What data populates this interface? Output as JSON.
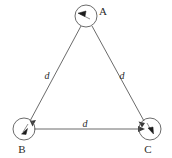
{
  "figure": {
    "type": "physics-diagram",
    "background_color": "#ffffff",
    "line_color": "#5a5a5a",
    "text_color": "#2b2b2b",
    "arrow_color": "#1c1c1c",
    "vertices": [
      {
        "id": "A",
        "label": "A",
        "position": {
          "x": 86,
          "y": 16
        },
        "radius": 11,
        "label_position": {
          "x": 103,
          "y": 14
        },
        "velocity_arrow": {
          "name": "velocity-vector-a",
          "direction_deg": 200,
          "description": "arrowhead pointing up-left toward B"
        }
      },
      {
        "id": "B",
        "label": "B",
        "position": {
          "x": 24,
          "y": 129
        },
        "radius": 11,
        "label_position": {
          "x": 21,
          "y": 152
        },
        "velocity_arrow": {
          "name": "velocity-vector-b",
          "direction_deg": 250,
          "description": "arrowhead pointing down-left toward C side"
        }
      },
      {
        "id": "C",
        "label": "C",
        "position": {
          "x": 150,
          "y": 129
        },
        "radius": 11,
        "label_position": {
          "x": 147,
          "y": 152
        },
        "velocity_arrow": {
          "name": "velocity-vector-c",
          "direction_deg": 330,
          "description": "arrowhead pointing down-right"
        }
      }
    ],
    "edges": [
      {
        "id": "AB",
        "from": "A",
        "to": "B",
        "label": "d",
        "label_position": {
          "x": 47,
          "y": 76
        },
        "arrow_at": "B"
      },
      {
        "id": "AC",
        "from": "A",
        "to": "C",
        "label": "d",
        "label_position": {
          "x": 122,
          "y": 76
        },
        "arrow_at": "C"
      },
      {
        "id": "BC",
        "from": "B",
        "to": "C",
        "label": "d",
        "label_position": {
          "x": 84,
          "y": 127
        },
        "arrow_at": "C"
      }
    ],
    "side_length_symbol": "d"
  }
}
